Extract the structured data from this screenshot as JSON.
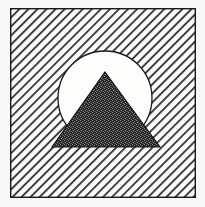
{
  "canvas": {
    "width": 205,
    "height": 207,
    "background_color": "#f8f8f6",
    "title": "Mountain and Sun Emblem"
  },
  "frame": {
    "name": "square-border",
    "x": 10,
    "y": 8,
    "width": 186,
    "height": 190,
    "stroke_color": "#1a1a1a",
    "stroke_width": 1.4,
    "fill": "none"
  },
  "hatch_background": {
    "name": "diagonal-hatch-fill",
    "angle_degrees": 45,
    "direction": "lower-left-to-upper-right",
    "line_spacing_px": 6.4,
    "line_width_px": 1.9,
    "line_color": "#3c3c3c",
    "field_color": "#fbfbf9"
  },
  "circle": {
    "name": "sun-circle",
    "center_x": 105,
    "center_y": 98,
    "radius": 47,
    "fill_color": "#fdfdfb",
    "stroke_color": "#1a1a1a",
    "stroke_width": 1.3
  },
  "triangle": {
    "name": "mountain-triangle",
    "apex_x": 105,
    "apex_y": 72,
    "base_left_x": 52,
    "base_right_x": 160,
    "base_y": 147,
    "fill_color": "#262626",
    "texture": "dense-dither-checker",
    "texture_highlight_color": "#8d8d8d",
    "stroke_color": "#111111",
    "stroke_width": 1.1
  },
  "labels": {
    "artwork_description": "Mountain and Sun Emblem",
    "frame_label": "square-border",
    "hatch_label": "diagonal-hatch-fill",
    "circle_label": "sun-circle",
    "triangle_label": "mountain-triangle"
  }
}
